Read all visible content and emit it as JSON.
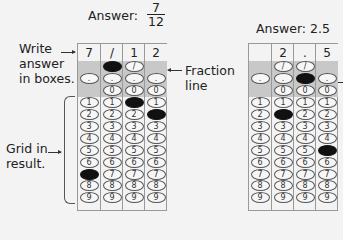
{
  "left": {
    "answer_label": "Answer:",
    "fraction": {
      "numerator": "7",
      "denominator": "12"
    },
    "boxes": [
      "7",
      "/",
      "1",
      "2"
    ],
    "filled": [
      {
        "col": 0,
        "row": "7"
      },
      {
        "col": 1,
        "row": "/"
      },
      {
        "col": 2,
        "row": "1"
      },
      {
        "col": 3,
        "row": "2"
      }
    ]
  },
  "right": {
    "answer_label": "Answer: 2.5",
    "boxes": [
      "",
      "2",
      ".",
      "5"
    ],
    "filled": [
      {
        "col": 1,
        "row": "2"
      },
      {
        "col": 2,
        "row": "."
      },
      {
        "col": 3,
        "row": "5"
      }
    ]
  },
  "annotations": {
    "write_answer": [
      "Write",
      "answer",
      "in boxes."
    ],
    "fraction_line": [
      "Fraction",
      "line"
    ],
    "grid_in": [
      "Grid in",
      "result."
    ]
  },
  "bubble_rows": [
    "/",
    ".",
    "0",
    "1",
    "2",
    "3",
    "4",
    "5",
    "6",
    "7",
    "8",
    "9"
  ],
  "colors": {
    "background": "#f3f3f3",
    "shade": "#c8c8c8",
    "filled": "#111111",
    "border": "#999999"
  }
}
